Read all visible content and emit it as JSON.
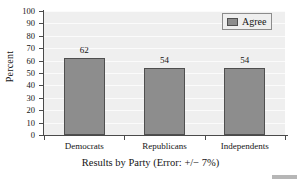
{
  "chart_data": {
    "type": "bar",
    "title": "",
    "categories": [
      "Democrats",
      "Republicans",
      "Independents"
    ],
    "values": [
      62,
      54,
      54
    ],
    "series": [
      {
        "name": "Agree",
        "values": [
          62,
          54,
          54
        ]
      }
    ],
    "xlabel": "Results by Party (Error: +/− 7%)",
    "ylabel": "Percent",
    "ylim": [
      0,
      100
    ],
    "ytick_labels": [
      "100",
      "90",
      "80",
      "70",
      "60",
      "50",
      "40",
      "30",
      "20",
      "10",
      "0"
    ],
    "ytick_values": [
      100,
      90,
      80,
      70,
      60,
      50,
      40,
      30,
      20,
      10,
      0
    ],
    "grid": true,
    "legend": {
      "position": "top-right",
      "entries": [
        "Agree"
      ]
    },
    "bar_value_labels": [
      "62",
      "54",
      "54"
    ],
    "colors": {
      "bar_fill": "#8d8d8d",
      "bar_border": "#4f4f4f",
      "plot_background": "#efefef",
      "gridline": "#fbfbfb",
      "axis": "#4a4a4a",
      "text": "#151515",
      "figure_background": "#ffffff"
    }
  }
}
